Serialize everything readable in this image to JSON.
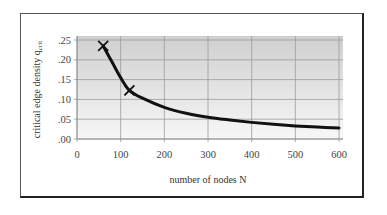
{
  "chart_data": {
    "type": "line",
    "title": "",
    "xlabel": "number of nodes N",
    "ylabel": "critical edge density q",
    "ylabel_subscript": "crit",
    "xlim": [
      0,
      600
    ],
    "ylim": [
      0,
      0.25
    ],
    "x_ticks": [
      0,
      100,
      200,
      300,
      400,
      500,
      600
    ],
    "x_tick_labels": [
      "0",
      "100",
      "200",
      "300",
      "400",
      "500",
      "600"
    ],
    "y_ticks": [
      0,
      0.05,
      0.1,
      0.15,
      0.2,
      0.25
    ],
    "y_tick_labels": [
      ".00",
      ".05",
      ".10",
      ".15",
      ".20",
      ".25"
    ],
    "grid": true,
    "legend": "none",
    "series": [
      {
        "name": "critical edge density curve",
        "style": "line",
        "color": "#111111",
        "x": [
          60,
          80,
          100,
          120,
          150,
          200,
          250,
          300,
          350,
          400,
          450,
          500,
          550,
          600
        ],
        "y": [
          0.235,
          0.195,
          0.155,
          0.123,
          0.103,
          0.08,
          0.065,
          0.055,
          0.048,
          0.042,
          0.037,
          0.033,
          0.03,
          0.028
        ]
      },
      {
        "name": "measured points",
        "style": "marker-x",
        "color": "#111111",
        "x": [
          60,
          120
        ],
        "y": [
          0.235,
          0.123
        ]
      }
    ],
    "plot_background": {
      "top": "#cfcfcf",
      "bottom": "#f7f7f7"
    },
    "gridline_color": "#9a9a9a"
  }
}
